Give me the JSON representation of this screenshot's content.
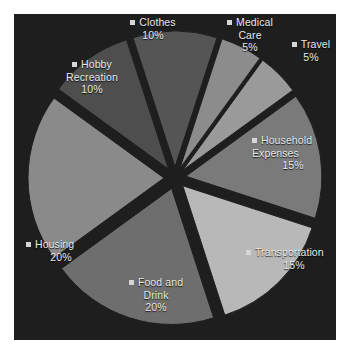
{
  "chart_data": {
    "type": "pie",
    "title": "",
    "exploded": true,
    "grayscale": true,
    "legend_position": "labels-around-slices",
    "units": "percent",
    "total": 100,
    "categories": [
      "Clothes",
      "Medical Care",
      "Travel",
      "Household Expenses",
      "Transportation",
      "Food and Drink",
      "Housing",
      "Hobby Recreation"
    ],
    "values": [
      10,
      5,
      5,
      15,
      15,
      20,
      20,
      10
    ],
    "slices": [
      {
        "label": "Clothes",
        "lines": [
          "Clothes"
        ],
        "percent_text": "10%",
        "value": 10,
        "color": "#555555",
        "start_deg": -18,
        "end_deg": 18,
        "explode": 11,
        "marker": "legend-square"
      },
      {
        "label": "Medical Care",
        "lines": [
          "Medical",
          "Care"
        ],
        "percent_text": "5%",
        "value": 5,
        "color": "#8c8c8c",
        "start_deg": 18,
        "end_deg": 36,
        "explode": 11,
        "marker": "legend-square"
      },
      {
        "label": "Travel",
        "lines": [
          "Travel"
        ],
        "percent_text": "5%",
        "value": 5,
        "color": "#9a9a9a",
        "start_deg": 36,
        "end_deg": 54,
        "explode": 11,
        "marker": "legend-square"
      },
      {
        "label": "Household Expenses",
        "lines": [
          "Household",
          "Expenses"
        ],
        "percent_text": "15%",
        "value": 15,
        "color": "#7a7a7a",
        "start_deg": 54,
        "end_deg": 108,
        "explode": 11,
        "marker": "legend-square"
      },
      {
        "label": "Transportation",
        "lines": [
          "Transportation"
        ],
        "percent_text": "15%",
        "value": 15,
        "color": "#b8b8b8",
        "start_deg": 108,
        "end_deg": 162,
        "explode": 11,
        "marker": "legend-square"
      },
      {
        "label": "Food and Drink",
        "lines": [
          "Food and",
          "Drink"
        ],
        "percent_text": "20%",
        "value": 20,
        "color": "#6e6e6e",
        "start_deg": 162,
        "end_deg": 234,
        "explode": 11,
        "marker": "legend-square"
      },
      {
        "label": "Housing",
        "lines": [
          "Housing"
        ],
        "percent_text": "20%",
        "value": 20,
        "color": "#8a8a8a",
        "start_deg": 234,
        "end_deg": 306,
        "explode": 11,
        "marker": "legend-square"
      },
      {
        "label": "Hobby Recreation",
        "lines": [
          "Hobby",
          "Recreation"
        ],
        "percent_text": "10%",
        "value": 10,
        "color": "#4e4e4e",
        "start_deg": 306,
        "end_deg": 342,
        "explode": 11,
        "marker": "legend-square"
      }
    ]
  },
  "labels": {
    "clothes": {
      "l1": "Clothes",
      "pct": "10%"
    },
    "medical": {
      "l1": "Medical",
      "l2": "Care",
      "pct": "5%"
    },
    "travel": {
      "l1": "Travel",
      "pct": "5%"
    },
    "household": {
      "l1": "Household",
      "l2": "Expenses",
      "pct": "15%"
    },
    "transportation": {
      "l1": "Transportation",
      "pct": "15%"
    },
    "food": {
      "l1": "Food and",
      "l2": "Drink",
      "pct": "20%"
    },
    "housing": {
      "l1": "Housing",
      "pct": "20%"
    },
    "hobby": {
      "l1": "Hobby",
      "l2": "Recreation",
      "pct": "10%"
    }
  },
  "panel": {
    "background": "#1e1e1e",
    "page_background": "#ffffff",
    "text_color": "#e9e9e9"
  }
}
